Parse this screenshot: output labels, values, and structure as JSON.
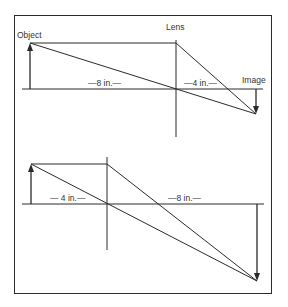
{
  "diagram": {
    "type": "optics-ray-diagram",
    "line_color": "#2a2a2a",
    "frame_color": "#2a2a2a",
    "panels": [
      {
        "name": "top",
        "labels": {
          "object": "Object",
          "lens": "Lens",
          "image": "Image",
          "object_distance": "—8 in.—",
          "image_distance": "—4 in.—"
        }
      },
      {
        "name": "bottom",
        "labels": {
          "object_distance": "— 4 in.—",
          "image_distance": "—8 in.—"
        }
      }
    ]
  }
}
